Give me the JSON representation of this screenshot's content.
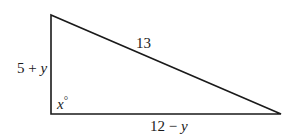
{
  "diagram": {
    "type": "right-triangle",
    "vertices": {
      "top": [
        51,
        15
      ],
      "right_angle": [
        51,
        114
      ],
      "right": [
        281,
        114
      ]
    },
    "labels": {
      "hypotenuse": "13",
      "vertical_leg_num": "5 + ",
      "vertical_leg_var": "y",
      "horizontal_leg_num": "12 − ",
      "horizontal_leg_var": "y",
      "angle_var": "x",
      "angle_unit": "°"
    },
    "stroke_color": "#1a1a1a"
  }
}
